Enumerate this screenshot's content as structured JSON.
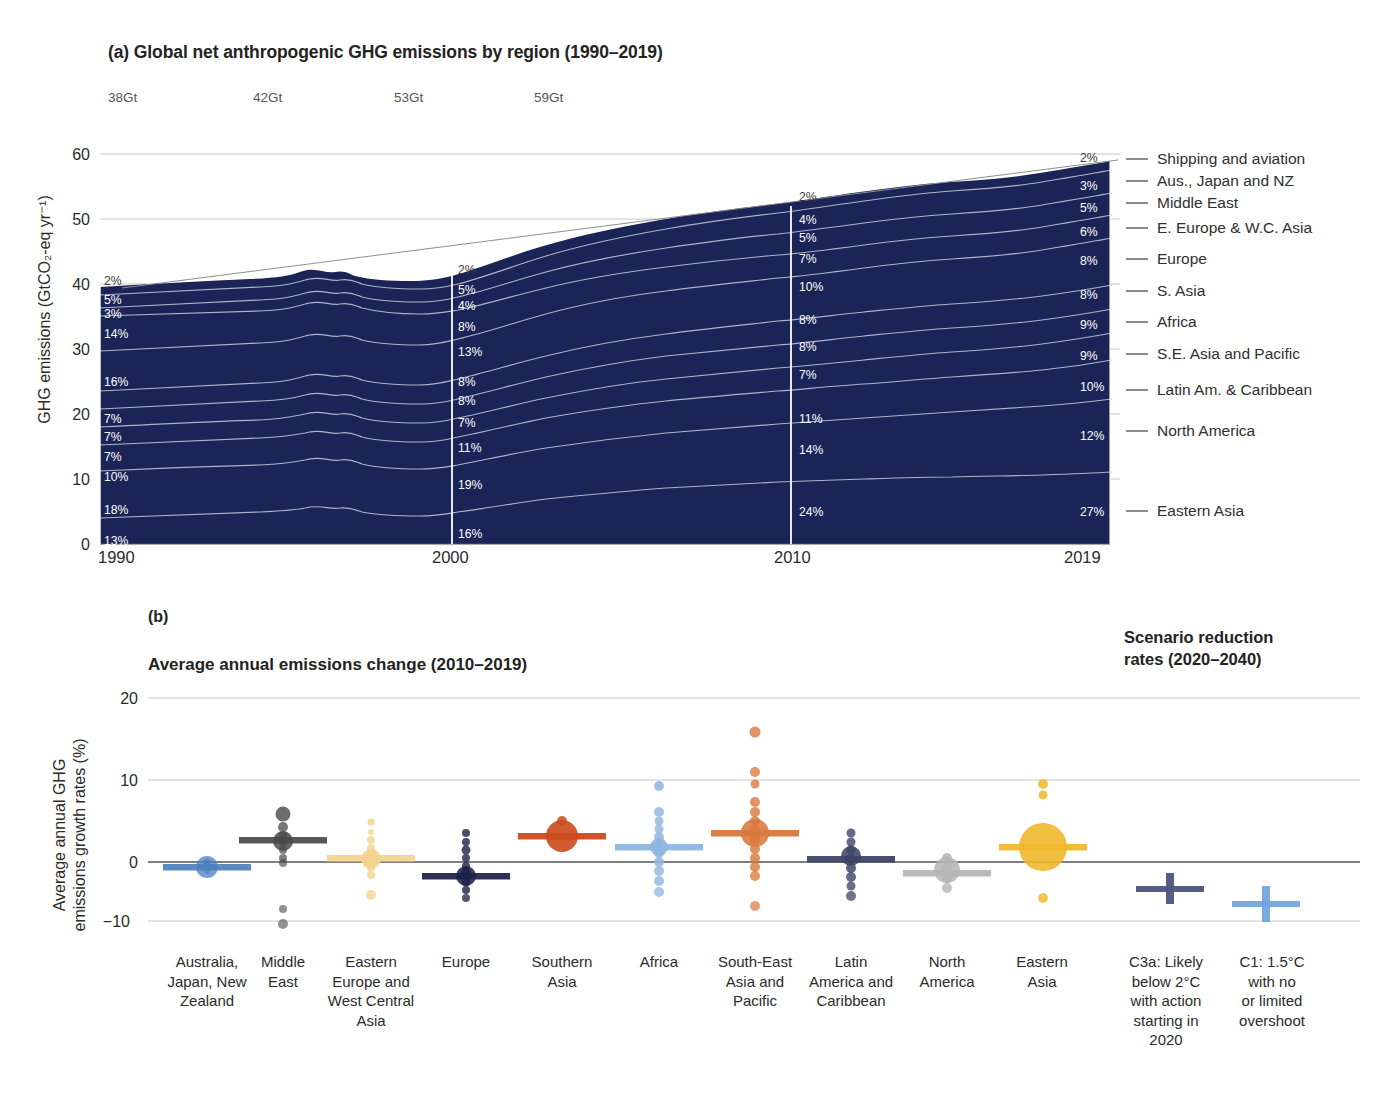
{
  "panel_a": {
    "title": "(a) Global net anthropogenic GHG emissions by region (1990–2019)",
    "ylabel": "GHG emissions (GtCO₂-eq yr⁻¹)",
    "yticks": [
      "60",
      "50",
      "40",
      "30",
      "20",
      "10",
      "0"
    ],
    "xticks": [
      "1990",
      "2000",
      "2010",
      "2019"
    ],
    "total_labels": [
      {
        "text": "38Gt",
        "year": 1990
      },
      {
        "text": "42Gt",
        "year": 2000
      },
      {
        "text": "53Gt",
        "year": 2010
      },
      {
        "text": "59Gt",
        "year": 2019
      }
    ],
    "legend": [
      "Shipping and aviation",
      "Aus., Japan and NZ",
      "Middle East",
      "E. Europe & W.C. Asia",
      "Europe",
      "S. Asia",
      "Africa",
      "S.E. Asia and Pacific",
      "Latin Am. & Caribbean",
      "North America",
      "Eastern Asia"
    ],
    "share_labels": {
      "1990": [
        "2%",
        "5%",
        "3%",
        "14%",
        "16%",
        "7%",
        "7%",
        "7%",
        "10%",
        "18%",
        "13%"
      ],
      "2000": [
        "2%",
        "5%",
        "4%",
        "8%",
        "13%",
        "8%",
        "8%",
        "7%",
        "11%",
        "19%",
        "16%"
      ],
      "2010": [
        "2%",
        "4%",
        "5%",
        "7%",
        "10%",
        "8%",
        "8%",
        "7%",
        "11%",
        "14%",
        "24%"
      ],
      "2019": [
        "2%",
        "3%",
        "5%",
        "6%",
        "8%",
        "8%",
        "9%",
        "9%",
        "10%",
        "12%",
        "27%"
      ]
    },
    "area_fill": "#1b2456",
    "separator_color": "#b9bfd4"
  },
  "panel_b": {
    "letter": "(b)",
    "title": "Average annual emissions change (2010–2019)",
    "right_title_line1": "Scenario reduction",
    "right_title_line2": "rates (2020–2040)",
    "ylabel_line1": "Average annual GHG",
    "ylabel_line2": "emissions growth rates (%)",
    "yticks": [
      "20",
      "10",
      "0",
      "−10"
    ],
    "categories": [
      {
        "label": "Australia,\nJapan, New\nZealand",
        "color": "#4a7ebd"
      },
      {
        "label": "Middle\nEast",
        "color": "#4a4a4a"
      },
      {
        "label": "Eastern\nEurope and\nWest Central\nAsia",
        "color": "#f3d48f"
      },
      {
        "label": "Europe",
        "color": "#1b2147"
      },
      {
        "label": "Southern\nAsia",
        "color": "#cc4a1c"
      },
      {
        "label": "Africa",
        "color": "#8fb6e0"
      },
      {
        "label": "South-East\nAsia and\nPacific",
        "color": "#d9783c"
      },
      {
        "label": "Latin\nAmerica and\nCaribbean",
        "color": "#3d4566"
      },
      {
        "label": "North\nAmerica",
        "color": "#b5b5b5"
      },
      {
        "label": "Eastern\nAsia",
        "color": "#f0b82c"
      },
      {
        "label": "C3a: Likely\nbelow 2°C\nwith action\nstarting in\n2020",
        "color": "#4e5580"
      },
      {
        "label": "C1: 1.5°C\nwith no\nor limited\novershoot",
        "color": "#74a5dd"
      }
    ]
  },
  "chart_data": [
    {
      "type": "area",
      "stacking": "stacked",
      "title": "(a) Global net anthropogenic GHG emissions by region (1990–2019)",
      "xlabel": "",
      "ylabel": "GHG emissions (GtCO2-eq yr-1)",
      "ylim": [
        0,
        60
      ],
      "xlim": [
        1990,
        2019
      ],
      "grid": true,
      "legend_position": "right",
      "x": [
        1990,
        1995,
        1997,
        1998,
        2000,
        2005,
        2010,
        2015,
        2019
      ],
      "total_gt": {
        "1990": 38,
        "2000": 42,
        "2010": 53,
        "2019": 59
      },
      "series_order_top_to_bottom": [
        "Shipping and aviation",
        "Aus., Japan and NZ",
        "Middle East",
        "E. Europe & W.C. Asia",
        "Europe",
        "S. Asia",
        "Africa",
        "S.E. Asia and Pacific",
        "Latin Am. & Caribbean",
        "North America",
        "Eastern Asia"
      ],
      "series_shares_percent": {
        "Shipping and aviation": {
          "1990": 2,
          "2000": 2,
          "2010": 2,
          "2019": 2
        },
        "Aus., Japan and NZ": {
          "1990": 5,
          "2000": 5,
          "2010": 4,
          "2019": 3
        },
        "Middle East": {
          "1990": 3,
          "2000": 4,
          "2010": 5,
          "2019": 5
        },
        "E. Europe & W.C. Asia": {
          "1990": 14,
          "2000": 8,
          "2010": 7,
          "2019": 6
        },
        "Europe": {
          "1990": 16,
          "2000": 13,
          "2010": 10,
          "2019": 8
        },
        "S. Asia": {
          "1990": 7,
          "2000": 8,
          "2010": 8,
          "2019": 8
        },
        "Africa": {
          "1990": 7,
          "2000": 8,
          "2010": 8,
          "2019": 9
        },
        "S.E. Asia and Pacific": {
          "1990": 7,
          "2000": 7,
          "2010": 7,
          "2019": 9
        },
        "Latin Am. & Caribbean": {
          "1990": 10,
          "2000": 11,
          "2010": 11,
          "2019": 10
        },
        "North America": {
          "1990": 18,
          "2000": 19,
          "2010": 14,
          "2019": 12
        },
        "Eastern Asia": {
          "1990": 13,
          "2000": 16,
          "2010": 24,
          "2019": 27
        }
      }
    },
    {
      "type": "scatter",
      "title": "Average annual emissions change (2010–2019)",
      "ylabel": "Average annual GHG emissions growth rates (%)",
      "ylim": [
        -10,
        20
      ],
      "yticks": [
        -10,
        0,
        10,
        20
      ],
      "grid": true,
      "categories": [
        "Australia, Japan, New Zealand",
        "Middle East",
        "Eastern Europe and West Central Asia",
        "Europe",
        "Southern Asia",
        "Africa",
        "South-East Asia and Pacific",
        "Latin America and Caribbean",
        "North America",
        "Eastern Asia",
        "C3a: Likely below 2°C with action starting in 2020",
        "C1: 1.5°C with no or limited overshoot"
      ],
      "region_mean_growth_percent": [
        -0.6,
        2.6,
        0.4,
        -1.4,
        3.0,
        1.9,
        3.4,
        0.4,
        -1.2,
        1.8,
        -3.5,
        -6.2
      ],
      "marker_sizes_relative": [
        10,
        9,
        8,
        9,
        14,
        7,
        13,
        9,
        8,
        22,
        6,
        6
      ],
      "country_points": {
        "Australia, Japan, New Zealand": [
          -0.6,
          -0.8,
          -0.3,
          -1.0
        ],
        "Middle East": [
          8.0,
          6.0,
          4.5,
          3.2,
          2.6,
          2.0,
          1.0,
          0.0,
          -6.0,
          -8.0
        ],
        "Eastern Europe and West Central Asia": [
          5.5,
          4.5,
          3.5,
          2.5,
          1.5,
          0.5,
          0.0,
          -1.0,
          -2.0,
          -4.2
        ],
        "Europe": [
          4.5,
          3.5,
          2.0,
          1.0,
          0.0,
          -1.0,
          -1.5,
          -2.0,
          -3.0,
          -4.0
        ],
        "Southern Asia": [
          5.0,
          3.5,
          3.0,
          2.8,
          2.5
        ],
        "Africa": [
          9.3,
          6.0,
          5.0,
          4.0,
          3.0,
          2.0,
          1.0,
          0.0,
          -1.0,
          -2.0,
          -3.5
        ],
        "South-East Asia and Pacific": [
          16.0,
          11.0,
          9.5,
          7.0,
          6.0,
          5.0,
          4.0,
          3.4,
          2.0,
          1.0,
          0.0,
          -1.5,
          -5.5
        ],
        "Latin America and Caribbean": [
          4.5,
          3.0,
          2.0,
          1.0,
          0.4,
          -0.5,
          -1.5,
          -2.5,
          -4.2
        ],
        "North America": [
          -0.5,
          -1.0,
          -1.2,
          -1.8,
          -2.8
        ],
        "Eastern Asia": [
          9.5,
          8.0,
          2.5,
          1.8,
          0.5,
          -1.0,
          -2.5
        ]
      }
    }
  ]
}
